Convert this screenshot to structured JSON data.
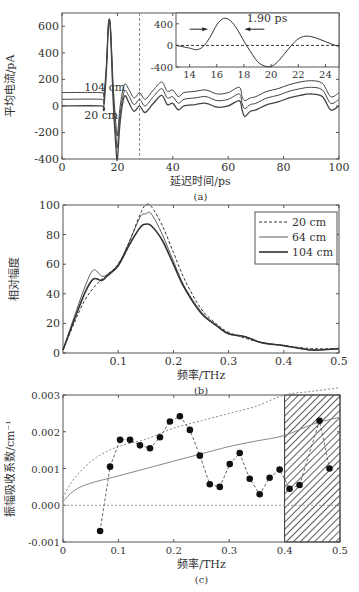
{
  "chart_data": [
    {
      "id": "a",
      "type": "line",
      "caption": "(a)",
      "xlabel": "延迟时间/ps",
      "ylabel": "平均电流/pA",
      "xlim": [
        0,
        100
      ],
      "ylim": [
        -400,
        700
      ],
      "xticks": [
        0,
        20,
        40,
        60,
        80,
        100
      ],
      "yticks": [
        -400,
        -200,
        0,
        200,
        400,
        600
      ],
      "vline_dashed_x": 28,
      "annotations": [
        {
          "text": "104 cm",
          "x": 8,
          "y": 140
        },
        {
          "text": "20 cm",
          "x": 8,
          "y": -70
        }
      ],
      "series": [
        {
          "name": "104 cm",
          "offset": 100,
          "x": [
            0,
            14,
            15,
            16,
            16.8,
            17.5,
            18.5,
            19.5,
            20,
            21,
            22.5,
            24,
            26,
            28,
            30,
            33,
            36,
            38,
            40,
            42,
            44,
            48,
            52,
            56,
            60,
            64,
            65,
            66,
            68,
            70,
            74,
            78,
            82,
            86,
            90,
            94,
            97,
            100
          ],
          "y": [
            0,
            0,
            -20,
            200,
            520,
            500,
            50,
            -250,
            -320,
            -100,
            60,
            30,
            -40,
            0,
            -50,
            20,
            80,
            10,
            20,
            -30,
            0,
            10,
            20,
            -10,
            0,
            40,
            -30,
            -60,
            -40,
            -30,
            10,
            30,
            60,
            80,
            90,
            70,
            -30,
            0
          ]
        },
        {
          "name": "64 cm",
          "offset": 50,
          "x": [
            0,
            14,
            15,
            16,
            16.8,
            17.5,
            18.5,
            19.5,
            20,
            21,
            22.5,
            24,
            26,
            28,
            30,
            33,
            36,
            38,
            40,
            42,
            44,
            48,
            52,
            56,
            60,
            64,
            65,
            66,
            68,
            70,
            74,
            78,
            82,
            86,
            90,
            94,
            97,
            100
          ],
          "y": [
            0,
            0,
            -20,
            220,
            560,
            520,
            40,
            -280,
            -360,
            -110,
            60,
            30,
            -40,
            0,
            -50,
            20,
            80,
            10,
            20,
            -30,
            0,
            10,
            20,
            -10,
            0,
            40,
            -30,
            -70,
            -40,
            -30,
            10,
            30,
            60,
            80,
            90,
            70,
            -30,
            0
          ]
        },
        {
          "name": "20 cm",
          "offset": 0,
          "x": [
            0,
            14,
            15,
            16,
            16.8,
            17.5,
            18.5,
            19.5,
            20,
            21,
            22.5,
            24,
            26,
            28,
            30,
            33,
            36,
            38,
            40,
            42,
            44,
            48,
            52,
            56,
            60,
            64,
            65,
            66,
            68,
            70,
            74,
            78,
            82,
            86,
            90,
            94,
            97,
            100
          ],
          "y": [
            0,
            0,
            -20,
            250,
            620,
            560,
            30,
            -320,
            -400,
            -120,
            70,
            30,
            -40,
            0,
            -50,
            20,
            80,
            10,
            20,
            -30,
            0,
            10,
            20,
            -10,
            0,
            40,
            -30,
            -80,
            -40,
            -30,
            10,
            30,
            60,
            80,
            90,
            70,
            -30,
            0
          ]
        }
      ],
      "inset": {
        "xlim": [
          13,
          25
        ],
        "ylim": [
          -400,
          600
        ],
        "xticks": [
          14,
          16,
          18,
          20,
          22,
          24
        ],
        "yticks": [
          -400,
          0,
          400
        ],
        "annotation": "1.90 ps",
        "baseline_dashed_y": 0,
        "x": [
          13,
          14,
          14.5,
          15,
          15.5,
          16,
          16.5,
          17,
          17.5,
          18,
          18.5,
          19,
          19.5,
          20,
          20.5,
          21,
          21.5,
          22,
          22.5,
          23,
          23.5,
          24,
          24.5,
          25
        ],
        "y": [
          0,
          -50,
          -80,
          -20,
          150,
          380,
          500,
          460,
          300,
          80,
          -120,
          -300,
          -380,
          -390,
          -300,
          -150,
          0,
          120,
          170,
          160,
          120,
          70,
          20,
          -20
        ]
      }
    },
    {
      "id": "b",
      "type": "line",
      "caption": "(b)",
      "xlabel": "频率/THz",
      "ylabel": "相对幅度",
      "xlim": [
        0,
        0.5
      ],
      "ylim": [
        0,
        100
      ],
      "xticks": [
        0.1,
        0.2,
        0.3,
        0.4,
        0.5
      ],
      "yticks": [
        0,
        20,
        40,
        60,
        80,
        100
      ],
      "legend": {
        "position": "upper right",
        "entries": [
          "20 cm",
          "64 cm",
          "104 cm"
        ]
      },
      "series": [
        {
          "name": "20 cm",
          "style": "dashed",
          "x": [
            0,
            0.02,
            0.04,
            0.06,
            0.08,
            0.1,
            0.12,
            0.14,
            0.15,
            0.16,
            0.18,
            0.2,
            0.22,
            0.25,
            0.28,
            0.3,
            0.33,
            0.36,
            0.4,
            0.45,
            0.5
          ],
          "y": [
            2,
            20,
            36,
            46,
            53,
            60,
            75,
            94,
            100,
            99,
            86,
            68,
            50,
            30,
            19,
            14,
            10,
            7,
            5,
            3,
            3
          ]
        },
        {
          "name": "64 cm",
          "style": "thin",
          "x": [
            0,
            0.02,
            0.04,
            0.055,
            0.07,
            0.08,
            0.1,
            0.12,
            0.14,
            0.15,
            0.16,
            0.18,
            0.2,
            0.22,
            0.25,
            0.28,
            0.3,
            0.33,
            0.36,
            0.4,
            0.45,
            0.5
          ],
          "y": [
            2,
            24,
            45,
            56,
            52,
            53,
            60,
            75,
            92,
            94,
            94,
            80,
            62,
            45,
            28,
            18,
            13,
            11,
            7,
            5,
            2,
            3
          ]
        },
        {
          "name": "104 cm",
          "style": "thick",
          "x": [
            0,
            0.02,
            0.04,
            0.055,
            0.07,
            0.08,
            0.1,
            0.12,
            0.14,
            0.15,
            0.16,
            0.18,
            0.2,
            0.22,
            0.25,
            0.28,
            0.3,
            0.33,
            0.36,
            0.4,
            0.45,
            0.5
          ],
          "y": [
            2,
            22,
            41,
            50,
            49,
            52,
            59,
            73,
            85,
            87,
            86,
            76,
            60,
            44,
            27,
            18,
            13,
            11,
            7,
            5,
            2,
            3
          ]
        }
      ]
    },
    {
      "id": "c",
      "type": "scatter",
      "caption": "(c)",
      "xlabel": "频率/THz",
      "ylabel": "振幅吸收系数/cm⁻¹",
      "xlim": [
        0,
        0.5
      ],
      "ylim": [
        -0.001,
        0.003
      ],
      "xticks": [
        0,
        0.1,
        0.2,
        0.3,
        0.4,
        0.5
      ],
      "yticks": [
        -0.001,
        0.0,
        0.001,
        0.002,
        0.003
      ],
      "ytick_labels": [
        "-0.001",
        "0.000",
        "0.001",
        "0.002",
        "0.003"
      ],
      "hatched_region_x": [
        0.4,
        0.5
      ],
      "series": [
        {
          "name": "measured",
          "style": "dashed-markers",
          "x": [
            0.067,
            0.085,
            0.103,
            0.121,
            0.139,
            0.157,
            0.175,
            0.193,
            0.211,
            0.229,
            0.247,
            0.265,
            0.283,
            0.301,
            0.319,
            0.337,
            0.355,
            0.373,
            0.391,
            0.409,
            0.427,
            0.463,
            0.481
          ],
          "y": [
            -0.0007,
            0.00105,
            0.00178,
            0.00178,
            0.00163,
            0.00155,
            0.00185,
            0.00228,
            0.00242,
            0.00205,
            0.00135,
            0.00057,
            0.0005,
            0.00112,
            0.00142,
            0.00072,
            0.0003,
            0.00075,
            0.00097,
            0.00045,
            0.00055,
            0.0023,
            0.001
          ]
        },
        {
          "name": "fit-upper",
          "style": "dotted",
          "x": [
            0,
            0.01,
            0.03,
            0.06,
            0.1,
            0.15,
            0.2,
            0.25,
            0.3,
            0.35,
            0.4,
            0.45,
            0.5
          ],
          "y": [
            0.0002,
            0.0005,
            0.0009,
            0.0013,
            0.0016,
            0.0018,
            0.0021,
            0.0023,
            0.0025,
            0.0027,
            0.003,
            0.0031,
            0.0032
          ]
        },
        {
          "name": "fit-lower",
          "style": "solid",
          "x": [
            0,
            0.02,
            0.05,
            0.1,
            0.15,
            0.2,
            0.25,
            0.3,
            0.35,
            0.4,
            0.45,
            0.5
          ],
          "y": [
            0.0001,
            0.0004,
            0.0006,
            0.0008,
            0.001,
            0.0012,
            0.0014,
            0.0016,
            0.00175,
            0.0019,
            0.0022,
            0.0024
          ]
        },
        {
          "name": "zero-line",
          "style": "dotted",
          "x": [
            0,
            0.5
          ],
          "y": [
            0,
            0
          ]
        }
      ]
    }
  ]
}
